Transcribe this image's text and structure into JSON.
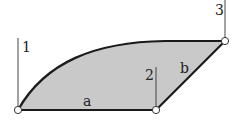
{
  "diagram": {
    "colors": {
      "fill": "#c9c9c9",
      "stroke": "#1a1a1a",
      "thin_line": "#444444",
      "node_fill": "#ffffff"
    },
    "nodes": [
      {
        "id": "A",
        "x": 18,
        "y": 110
      },
      {
        "id": "B",
        "x": 156,
        "y": 110
      },
      {
        "id": "C",
        "x": 225,
        "y": 41
      }
    ],
    "verticals": [
      {
        "label": "1",
        "x": 18,
        "y_top": 38,
        "y_bottom": 110,
        "label_x": 22,
        "label_y": 52
      },
      {
        "label": "2",
        "x": 156,
        "y_top": 67,
        "y_bottom": 110,
        "label_x": 145,
        "label_y": 80
      },
      {
        "label": "3",
        "x": 225,
        "y_top": 0,
        "y_bottom": 41,
        "label_x": 215,
        "label_y": 15
      }
    ],
    "edge_labels": [
      {
        "label": "a",
        "x": 83,
        "y": 106
      },
      {
        "label": "b",
        "x": 180,
        "y": 73
      }
    ]
  }
}
